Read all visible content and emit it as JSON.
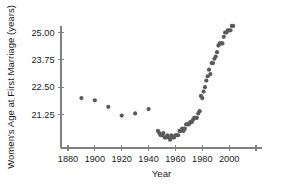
{
  "chart_data": {
    "type": "scatter",
    "title": "",
    "xlabel": "Year",
    "ylabel": "Women's Age at First Marriage (years)",
    "xlim": [
      1875,
      2022
    ],
    "ylim": [
      20.1,
      25.6
    ],
    "grid": false,
    "legend": null,
    "x_ticks": [
      1880,
      1900,
      1920,
      1940,
      1960,
      1980,
      2000,
      2020
    ],
    "x_tick_labels": [
      "1880",
      "1900",
      "1920",
      "1940",
      "1960",
      "1980",
      "2000",
      ""
    ],
    "y_ticks": [
      21.25,
      22.5,
      23.75,
      25.0
    ],
    "y_tick_labels": [
      "21.25",
      "22.50",
      "23.75",
      "25.00"
    ],
    "marker_color": "#5a5a5a",
    "marker_size": 2.1,
    "axis_color": "#808080",
    "x": [
      1890,
      1900,
      1910,
      1920,
      1930,
      1940,
      1947,
      1948,
      1949,
      1950,
      1951,
      1952,
      1953,
      1954,
      1955,
      1956,
      1957,
      1958,
      1959,
      1960,
      1961,
      1962,
      1963,
      1964,
      1965,
      1966,
      1967,
      1968,
      1969,
      1970,
      1971,
      1972,
      1973,
      1974,
      1975,
      1976,
      1977,
      1978,
      1979,
      1980,
      1981,
      1982,
      1983,
      1984,
      1985,
      1986,
      1987,
      1988,
      1989,
      1990,
      1991,
      1992,
      1993,
      1994,
      1995,
      1996,
      1997,
      1998,
      1999,
      2000,
      2001,
      2002,
      2003
    ],
    "y": [
      22.0,
      21.9,
      21.6,
      21.2,
      21.3,
      21.5,
      20.5,
      20.4,
      20.3,
      20.3,
      20.4,
      20.2,
      20.2,
      20.3,
      20.2,
      20.1,
      20.3,
      20.2,
      20.2,
      20.3,
      20.3,
      20.3,
      20.5,
      20.5,
      20.6,
      20.5,
      20.6,
      20.8,
      20.8,
      20.8,
      20.9,
      20.9,
      21.0,
      21.1,
      21.1,
      21.1,
      21.3,
      21.4,
      22.1,
      22.0,
      22.3,
      22.5,
      22.8,
      23.0,
      23.3,
      23.1,
      23.6,
      23.6,
      23.8,
      23.9,
      24.1,
      24.4,
      24.5,
      24.5,
      24.5,
      24.8,
      25.0,
      25.0,
      25.1,
      25.1,
      25.1,
      25.3,
      25.3
    ],
    "points": [
      {
        "year": 1890,
        "age": 22.0
      },
      {
        "year": 1900,
        "age": 21.9
      },
      {
        "year": 1910,
        "age": 21.6
      },
      {
        "year": 1920,
        "age": 21.2
      },
      {
        "year": 1930,
        "age": 21.3
      },
      {
        "year": 1940,
        "age": 21.5
      }
    ]
  }
}
